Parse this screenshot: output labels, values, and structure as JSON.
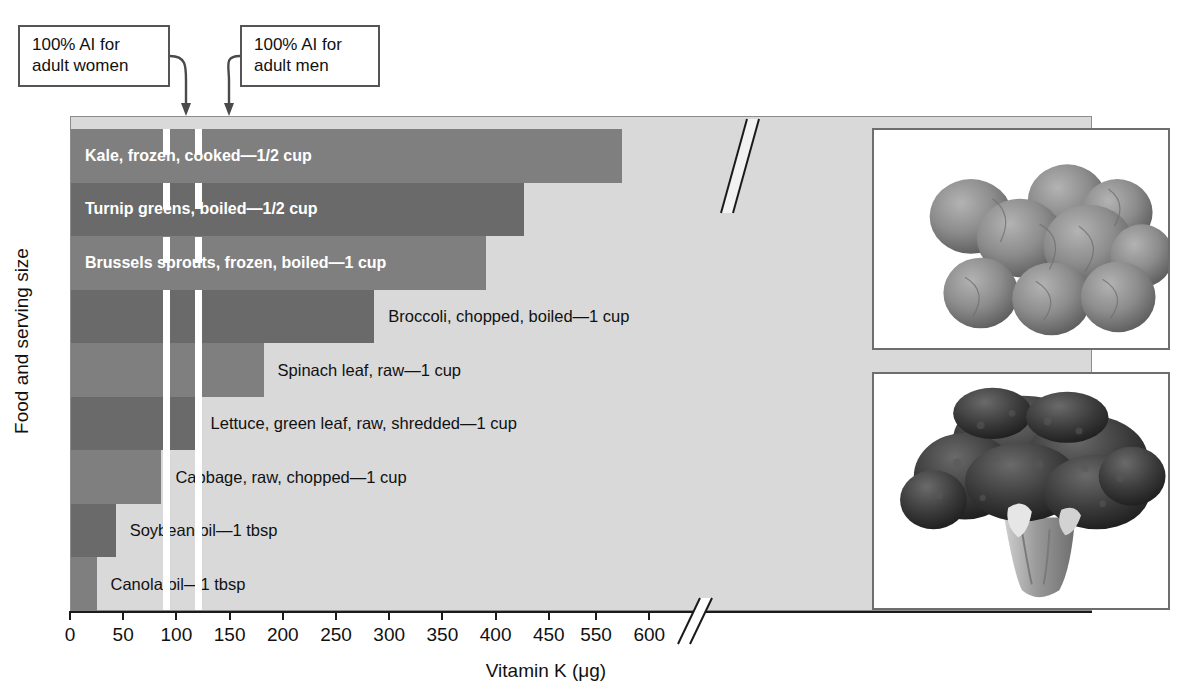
{
  "chart_data": {
    "type": "bar",
    "orientation": "horizontal",
    "title": "",
    "xlabel": "Vitamin K (μg)",
    "ylabel": "Food and serving size",
    "xlim": [
      0,
      620
    ],
    "axis_break": {
      "from": 460,
      "to": 540,
      "label": "//"
    },
    "xticks": [
      0,
      50,
      100,
      150,
      200,
      250,
      300,
      350,
      400,
      450,
      550,
      600
    ],
    "xticklabels": [
      "0",
      "50",
      "100",
      "150",
      "200",
      "250",
      "300",
      "350",
      "400",
      "450",
      "550",
      "600"
    ],
    "grid": false,
    "legend": "none",
    "categories": [
      "Kale, frozen, cooked—1/2 cup",
      "Turnip greens, boiled—1/2 cup",
      "Brussels sprouts, frozen, boiled—1 cup",
      "Broccoli, chopped, boiled—1 cup",
      "Spinach leaf, raw—1 cup",
      "Lettuce, green leaf, raw, shredded—1 cup",
      "Cabbage, raw, chopped—1 cup",
      "Soybean oil—1 tbsp",
      "Canola oil—1 tbsp"
    ],
    "values": [
      573,
      426,
      390,
      285,
      181,
      118,
      85,
      42,
      24
    ],
    "reference_lines": [
      {
        "name": "100% AI for adult women",
        "value": 90,
        "style": "dashed-white"
      },
      {
        "name": "100% AI for adult men",
        "value": 120,
        "style": "dashed-white"
      }
    ],
    "annotations": [
      {
        "name": "callout-women",
        "text": "100% AI for\nadult women",
        "points_to": 90
      },
      {
        "name": "callout-men",
        "text": "100% AI for\nadult men",
        "points_to": 120
      }
    ]
  },
  "callouts": {
    "women": "100% AI for\nadult women",
    "men": "100% AI for\nadult men"
  },
  "bars": [
    {
      "label": "Kale, frozen, cooked—1/2 cup",
      "value": 573,
      "label_position": "inside"
    },
    {
      "label": "Turnip greens, boiled—1/2 cup",
      "value": 426,
      "label_position": "inside"
    },
    {
      "label": "Brussels sprouts, frozen, boiled—1 cup",
      "value": 390,
      "label_position": "inside"
    },
    {
      "label": "Broccoli, chopped, boiled—1 cup",
      "value": 285,
      "label_position": "outside"
    },
    {
      "label": "Spinach leaf, raw—1 cup",
      "value": 181,
      "label_position": "outside"
    },
    {
      "label": "Lettuce, green leaf, raw, shredded—1 cup",
      "value": 118,
      "label_position": "outside"
    },
    {
      "label": "Cabbage, raw, chopped—1 cup",
      "value": 85,
      "label_position": "outside"
    },
    {
      "label": "Soybean oil—1 tbsp",
      "value": 42,
      "label_position": "outside"
    },
    {
      "label": "Canola oil—1 tbsp",
      "value": 24,
      "label_position": "outside"
    }
  ],
  "axis": {
    "x_title": "Vitamin K (μg)",
    "y_title": "Food and serving size",
    "ticks": [
      "0",
      "50",
      "100",
      "150",
      "200",
      "250",
      "300",
      "350",
      "400",
      "450",
      "550",
      "600"
    ],
    "break_symbol": "//"
  },
  "photos": [
    {
      "name": "brussels-sprouts-photo",
      "subject": "Brussels sprouts"
    },
    {
      "name": "broccoli-photo",
      "subject": "Broccoli head"
    }
  ],
  "colors": {
    "plot_background": "#d9d9d9",
    "bar_light": "#7f7f7f",
    "bar_dark": "#6a6a6a",
    "reference_line": "#ffffff",
    "axis": "#1a1a1a",
    "text": "#111111",
    "inside_label": "#ffffff"
  }
}
